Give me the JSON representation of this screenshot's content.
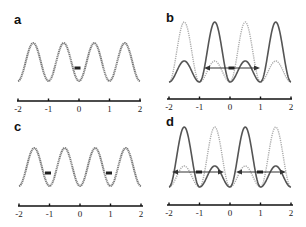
{
  "figure": {
    "panels": [
      {
        "label": "a"
      },
      {
        "label": "b"
      },
      {
        "label": "c"
      },
      {
        "label": "d"
      }
    ],
    "colors": {
      "dark_curve": "#555555",
      "light_curve": "#aaaaaa",
      "axis": "#111111",
      "arrow": "#333333"
    }
  },
  "chart_data": [
    {
      "panel": "a",
      "type": "line",
      "title": "",
      "xlabel": "",
      "ylabel": "",
      "x_ticks": [
        "-2",
        "-1",
        "0",
        "1",
        "2"
      ],
      "xlim": [
        -2,
        2
      ],
      "grid": false,
      "series": [
        {
          "name": "potential",
          "style": "solid-dark",
          "description": "uniform cosine wave, period 1, troughs at integers, peaks at half-integers",
          "peaks_x": [
            -1.5,
            -0.5,
            0.5,
            1.5
          ],
          "troughs_x": [
            -2,
            -1,
            0,
            1,
            2
          ]
        }
      ],
      "markers": [
        {
          "x": 0,
          "shape": "dash"
        }
      ],
      "arrows": []
    },
    {
      "panel": "b",
      "type": "line",
      "title": "",
      "xlabel": "",
      "ylabel": "",
      "x_ticks": [
        "-2",
        "-1",
        "0",
        "1",
        "2"
      ],
      "xlim": [
        -2,
        2
      ],
      "grid": false,
      "series": [
        {
          "name": "state-1",
          "style": "solid-dark",
          "tall_peaks_x": [
            -0.5,
            1.5
          ],
          "small_peaks_x": [
            -1.5,
            0.5
          ],
          "troughs_x": [
            -2,
            -1,
            0,
            1,
            2
          ],
          "tall_peak_rel_height": 1.0,
          "small_peak_rel_height": 0.35
        },
        {
          "name": "state-2",
          "style": "dotted-light",
          "tall_peaks_x": [
            -1.5,
            0.5
          ],
          "small_peaks_x": [
            -0.5,
            1.5
          ],
          "troughs_x": [
            -2,
            -1,
            0,
            1,
            2
          ],
          "tall_peak_rel_height": 1.0,
          "small_peak_rel_height": 0.35
        }
      ],
      "markers": [
        {
          "x": 0,
          "shape": "dash"
        }
      ],
      "arrows": [
        {
          "from_x": -0.8,
          "to_x": 0.8,
          "center_x": 0,
          "double_headed": true
        }
      ]
    },
    {
      "panel": "c",
      "type": "line",
      "title": "",
      "xlabel": "",
      "ylabel": "",
      "x_ticks": [
        "-2",
        "-1",
        "0",
        "1",
        "2"
      ],
      "xlim": [
        -2,
        2
      ],
      "grid": false,
      "series": [
        {
          "name": "potential",
          "style": "solid-dark",
          "description": "uniform cosine wave, period 1, troughs at integers, peaks at half-integers",
          "peaks_x": [
            -1.5,
            -0.5,
            0.5,
            1.5
          ],
          "troughs_x": [
            -2,
            -1,
            0,
            1,
            2
          ]
        }
      ],
      "markers": [
        {
          "x": -1,
          "shape": "dash"
        },
        {
          "x": 1,
          "shape": "dash"
        }
      ],
      "arrows": []
    },
    {
      "panel": "d",
      "type": "line",
      "title": "",
      "xlabel": "",
      "ylabel": "",
      "x_ticks": [
        "-2",
        "-1",
        "0",
        "1",
        "2"
      ],
      "xlim": [
        -2,
        2
      ],
      "grid": false,
      "series": [
        {
          "name": "state-1",
          "style": "solid-dark",
          "tall_peaks_x": [
            -1.5,
            0.5
          ],
          "small_peaks_x": [
            -0.5,
            1.5
          ],
          "troughs_x": [
            -2,
            -1,
            0,
            1,
            2
          ],
          "tall_peak_rel_height": 1.0,
          "small_peak_rel_height": 0.35
        },
        {
          "name": "state-2",
          "style": "dotted-light",
          "tall_peaks_x": [
            -0.5,
            1.5
          ],
          "small_peaks_x": [
            -1.5,
            0.5
          ],
          "troughs_x": [
            -2,
            -1,
            0,
            1,
            2
          ],
          "tall_peak_rel_height": 1.0,
          "small_peak_rel_height": 0.35
        }
      ],
      "markers": [
        {
          "x": -1,
          "shape": "dash"
        },
        {
          "x": 1,
          "shape": "dash"
        }
      ],
      "arrows": [
        {
          "from_x": -1.8,
          "to_x": -0.2,
          "center_x": -1,
          "double_headed": true
        },
        {
          "from_x": 0.2,
          "to_x": 1.8,
          "center_x": 1,
          "double_headed": true
        }
      ]
    }
  ]
}
